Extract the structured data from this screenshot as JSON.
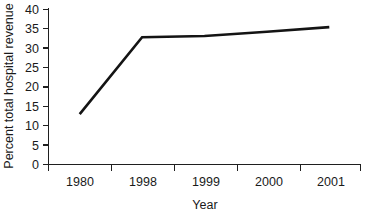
{
  "chart_data": {
    "type": "line",
    "title": "",
    "xlabel": "Year",
    "ylabel": "Percent total hospital revenue",
    "categories": [
      "1980",
      "1998",
      "1999",
      "2000",
      "2001"
    ],
    "series": [
      {
        "name": "Percent total hospital revenue",
        "values": [
          13.0,
          32.8,
          33.1,
          34.2,
          35.4
        ]
      }
    ],
    "yticks": [
      "0",
      "5",
      "10",
      "15",
      "20",
      "25",
      "30",
      "35",
      "40"
    ],
    "ylim": [
      0,
      40
    ],
    "grid": false,
    "legend": "none",
    "line_color": "#141414",
    "axis_color": "#1f1f1f",
    "background_color": "#ffffff"
  },
  "axis": {
    "y_title": "Percent total hospital revenue",
    "x_title": "Year"
  },
  "yticks": {
    "t0": "0",
    "t1": "5",
    "t2": "10",
    "t3": "15",
    "t4": "20",
    "t5": "25",
    "t6": "30",
    "t7": "35",
    "t8": "40"
  },
  "xticks": {
    "c0": "1980",
    "c1": "1998",
    "c2": "1999",
    "c3": "2000",
    "c4": "2001"
  }
}
